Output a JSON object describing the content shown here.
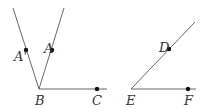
{
  "figure": {
    "angle_left": {
      "vertex": {
        "label": "B",
        "x": 39,
        "y": 89
      },
      "rays": [
        {
          "to": [
            13,
            8
          ]
        },
        {
          "to": [
            64,
            8
          ]
        },
        {
          "to": [
            107,
            89
          ]
        }
      ],
      "points": [
        {
          "label": "A'",
          "x": 26,
          "y": 50
        },
        {
          "label": "A",
          "x": 52,
          "y": 50
        },
        {
          "label": "C",
          "x": 97,
          "y": 89
        }
      ]
    },
    "angle_right": {
      "vertex": {
        "label": "E",
        "x": 131,
        "y": 89
      },
      "rays": [
        {
          "to": [
            195,
            22
          ]
        },
        {
          "to": [
            196,
            89
          ]
        }
      ],
      "points": [
        {
          "label": "D",
          "x": 169,
          "y": 49
        },
        {
          "label": "F",
          "x": 188,
          "y": 89
        }
      ]
    }
  },
  "labels": {
    "a_prime": "A'",
    "a": "A",
    "b": "B",
    "c": "C",
    "d": "D",
    "e": "E",
    "f": "F"
  }
}
